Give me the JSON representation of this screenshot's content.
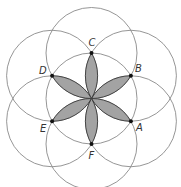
{
  "diagram": {
    "type": "six-petal rosette (flower of life construction)",
    "center": {
      "x": 91.5,
      "y": 98.5
    },
    "radius": 45.5,
    "colors": {
      "circle_stroke": "#8a8a8a",
      "petal_fill": "#a3a3a3",
      "petal_stroke": "#3a3a3a",
      "point": "#111111",
      "label": "#333333"
    },
    "points": [
      {
        "name": "A",
        "angle_deg": 30,
        "label_dx": 5,
        "label_dy": 10
      },
      {
        "name": "B",
        "angle_deg": -30,
        "label_dx": 4,
        "label_dy": -4
      },
      {
        "name": "C",
        "angle_deg": -90,
        "label_dx": -3,
        "label_dy": -7
      },
      {
        "name": "D",
        "angle_deg": 210,
        "label_dx": -13,
        "label_dy": -2
      },
      {
        "name": "E",
        "angle_deg": 150,
        "label_dx": -12,
        "label_dy": 11
      },
      {
        "name": "F",
        "angle_deg": 90,
        "label_dx": -3,
        "label_dy": 15
      }
    ]
  }
}
